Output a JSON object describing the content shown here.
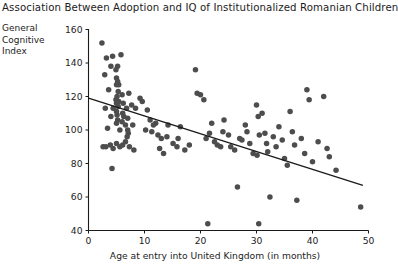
{
  "chart_data": {
    "type": "scatter",
    "title": "Association Between Adoption and IQ of Institutionalized Romanian Children",
    "xlabel": "Age at entry into United Kingdom (in months)",
    "ylabel": "General Cognitive Index",
    "ylabel_lines": [
      "General",
      "Cognitive",
      "Index"
    ],
    "xlim": [
      0,
      50
    ],
    "ylim": [
      40,
      160
    ],
    "xticks": [
      0,
      10,
      20,
      30,
      40,
      50
    ],
    "yticks": [
      40,
      60,
      80,
      100,
      120,
      140,
      160
    ],
    "grid": false,
    "legend": null,
    "marker_color": "#4d4d4d",
    "line_color": "#1a1a1a",
    "trendline": {
      "type": "linear-regression",
      "x_start": 0,
      "y_start": 119,
      "x_end": 49,
      "y_end": 67
    },
    "points": [
      [
        2.4,
        152
      ],
      [
        3.2,
        143
      ],
      [
        4.3,
        144
      ],
      [
        5.8,
        145
      ],
      [
        4.0,
        138
      ],
      [
        5.2,
        138
      ],
      [
        4.9,
        136
      ],
      [
        2.9,
        133
      ],
      [
        5.0,
        131
      ],
      [
        5.2,
        129
      ],
      [
        5.0,
        127
      ],
      [
        5.4,
        127
      ],
      [
        3.6,
        124
      ],
      [
        5.3,
        123
      ],
      [
        7.2,
        122
      ],
      [
        6.0,
        121
      ],
      [
        5.1,
        120
      ],
      [
        4.9,
        118
      ],
      [
        5.4,
        117
      ],
      [
        5.0,
        116
      ],
      [
        6.2,
        116
      ],
      [
        7.7,
        115
      ],
      [
        5.3,
        114
      ],
      [
        3.0,
        113
      ],
      [
        4.4,
        113
      ],
      [
        6.8,
        113
      ],
      [
        8.4,
        113
      ],
      [
        5.0,
        111
      ],
      [
        6.1,
        110
      ],
      [
        5.1,
        109
      ],
      [
        4.0,
        108
      ],
      [
        6.3,
        108
      ],
      [
        7.0,
        107
      ],
      [
        5.2,
        106
      ],
      [
        6.0,
        105
      ],
      [
        5.0,
        104
      ],
      [
        6.6,
        103
      ],
      [
        7.9,
        103
      ],
      [
        3.4,
        101
      ],
      [
        5.6,
        100
      ],
      [
        7.0,
        100
      ],
      [
        7.1,
        98
      ],
      [
        6.9,
        96
      ],
      [
        2.6,
        90
      ],
      [
        3.1,
        90
      ],
      [
        3.9,
        91
      ],
      [
        4.4,
        89
      ],
      [
        5.0,
        92
      ],
      [
        5.6,
        90
      ],
      [
        6.1,
        91
      ],
      [
        6.6,
        93
      ],
      [
        7.3,
        90
      ],
      [
        8.1,
        88
      ],
      [
        4.2,
        77
      ],
      [
        9.2,
        119
      ],
      [
        9.6,
        117
      ],
      [
        10.5,
        112
      ],
      [
        11.0,
        106
      ],
      [
        10.2,
        100
      ],
      [
        11.3,
        99
      ],
      [
        12.0,
        104
      ],
      [
        11.6,
        103
      ],
      [
        12.4,
        97
      ],
      [
        13.0,
        95
      ],
      [
        12.7,
        89
      ],
      [
        13.4,
        86
      ],
      [
        14.2,
        103
      ],
      [
        14.0,
        96
      ],
      [
        15.1,
        92
      ],
      [
        15.8,
        90
      ],
      [
        16.4,
        102
      ],
      [
        16.0,
        95
      ],
      [
        17.2,
        88
      ],
      [
        18.0,
        91
      ],
      [
        19.1,
        136
      ],
      [
        19.4,
        122
      ],
      [
        20.0,
        121
      ],
      [
        20.6,
        118
      ],
      [
        21.3,
        44
      ],
      [
        21.0,
        95
      ],
      [
        22.0,
        104
      ],
      [
        21.6,
        98
      ],
      [
        22.5,
        93
      ],
      [
        23.0,
        91
      ],
      [
        23.6,
        90
      ],
      [
        24.2,
        106
      ],
      [
        24.0,
        99
      ],
      [
        25.0,
        97
      ],
      [
        25.4,
        90
      ],
      [
        26.1,
        88
      ],
      [
        26.6,
        66
      ],
      [
        27.0,
        95
      ],
      [
        27.4,
        94
      ],
      [
        28.0,
        103
      ],
      [
        28.3,
        99
      ],
      [
        28.8,
        92
      ],
      [
        29.4,
        86
      ],
      [
        30.0,
        115
      ],
      [
        30.3,
        108
      ],
      [
        30.5,
        97
      ],
      [
        30.1,
        85
      ],
      [
        30.4,
        44
      ],
      [
        31.0,
        110
      ],
      [
        31.5,
        98
      ],
      [
        31.8,
        92
      ],
      [
        32.0,
        87
      ],
      [
        32.4,
        60
      ],
      [
        33.0,
        96
      ],
      [
        33.5,
        90
      ],
      [
        34.0,
        102
      ],
      [
        34.6,
        94
      ],
      [
        35.0,
        83
      ],
      [
        35.5,
        79
      ],
      [
        36.0,
        111
      ],
      [
        36.4,
        99
      ],
      [
        36.8,
        91
      ],
      [
        37.2,
        58
      ],
      [
        38.0,
        95
      ],
      [
        38.6,
        86
      ],
      [
        39.0,
        124
      ],
      [
        39.4,
        118
      ],
      [
        40.0,
        81
      ],
      [
        41.0,
        93
      ],
      [
        42.0,
        120
      ],
      [
        42.6,
        89
      ],
      [
        43.0,
        84
      ],
      [
        44.2,
        76
      ],
      [
        48.6,
        54
      ]
    ]
  }
}
